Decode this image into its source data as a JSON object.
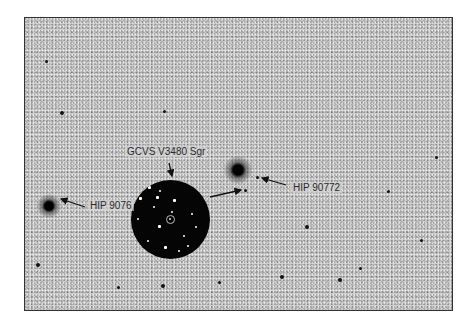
{
  "figure": {
    "type": "star field finder chart (inverted/negative image)",
    "inset": "circular positive-image zoom around target star"
  },
  "labels": {
    "target": "GCVS V3480 Sgr",
    "comp_left": "HIP 90761",
    "comp_left_visible": "HIP 9076",
    "comp_right": "HIP 90772"
  },
  "colors": {
    "background": "#cfcfcf",
    "stars": "#111111",
    "inset_bg": "#050505",
    "frame_border": "#333333"
  }
}
